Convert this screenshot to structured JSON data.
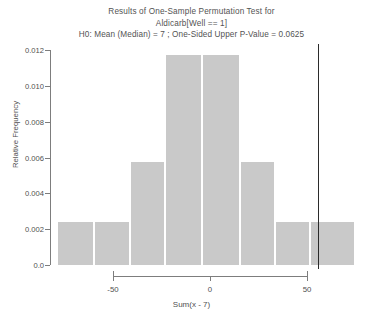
{
  "chart_data": {
    "type": "bar",
    "title": "Results of One-Sample Permutation Test for",
    "subtitle": "Aldicarb[Well == 1]",
    "subtitle2": "H0: Mean (Median) = 7 ;  One-Sided Upper P-Value = 0.0625",
    "xlabel": "Sum(x - 7)",
    "ylabel": "Relative Frequency",
    "xlim": [
      -78,
      82
    ],
    "ylim": [
      0,
      0.0128
    ],
    "xticks": [
      -50,
      0,
      50
    ],
    "xtick_labels": [
      "-50",
      "0",
      "50"
    ],
    "yticks": [
      0,
      0.002,
      0.004,
      0.006,
      0.008,
      0.01,
      0.012
    ],
    "ytick_labels": [
      "0.0",
      "0.002",
      "0.004",
      "0.006",
      "0.008",
      "0.010",
      "0.012"
    ],
    "grid": false,
    "legend": false,
    "bar_color": "#c9c9c9",
    "bar_edge_color": "#ffffff",
    "bin_edges": [
      -78,
      -58,
      -39,
      -20,
      0,
      20,
      39,
      58,
      82
    ],
    "bins": [
      {
        "left": -78,
        "right": -58,
        "value": 0.0025
      },
      {
        "left": -58,
        "right": -39,
        "value": 0.0025
      },
      {
        "left": -39,
        "right": -20,
        "value": 0.006
      },
      {
        "left": -20,
        "right": 0,
        "value": 0.0122
      },
      {
        "left": 0,
        "right": 20,
        "value": 0.0122
      },
      {
        "left": 20,
        "right": 39,
        "value": 0.006
      },
      {
        "left": 39,
        "right": 58,
        "value": 0.0025
      },
      {
        "left": 58,
        "right": 82,
        "value": 0.0025
      }
    ],
    "categories": [
      "-78 to -58",
      "-58 to -39",
      "-39 to -20",
      "-20 to 0",
      "0 to 20",
      "20 to 39",
      "39 to 58",
      "58 to 82"
    ],
    "values": [
      0.0025,
      0.0025,
      0.006,
      0.0122,
      0.0122,
      0.006,
      0.0025,
      0.0025
    ],
    "annotations": [
      {
        "name": "observed-statistic-line",
        "type": "vline",
        "x": 62,
        "color": "#2b2b2b"
      }
    ]
  }
}
